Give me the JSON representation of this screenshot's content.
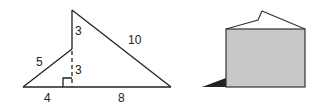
{
  "figures": [
    {
      "name": "triangle-figure",
      "labels": {
        "upper_vertical": "3",
        "hypotenuse_right": "10",
        "hypotenuse_left": "5",
        "lower_vertical": "3",
        "base_left": "4",
        "base_right": "8"
      }
    },
    {
      "name": "box-figure",
      "colors": {
        "fill": "#c8c8c8",
        "stroke": "#333333",
        "shadow": "#222222"
      }
    }
  ]
}
